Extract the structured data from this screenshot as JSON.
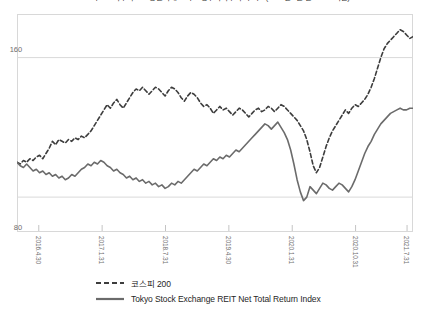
{
  "chart_data": {
    "type": "line",
    "title": "코스피 200 지수와 도쿄증권거래소 리츠 총수익지수 추이 비교(2016년 4월 말 = 100 기준)",
    "xlabel": "",
    "ylabel": "",
    "ylim": [
      60,
      185
    ],
    "yticks": [
      160,
      80
    ],
    "ytick_labels": [
      "160",
      "80"
    ],
    "grid": true,
    "legend_position": "bottom",
    "x_tick_labels": [
      "2016.4.30",
      "2017.1.31",
      "2018.7.31",
      "2019.4.30",
      "2020.1.31",
      "2020.10.31",
      "2021.7.31"
    ],
    "x_tick_positions": [
      0.055,
      0.215,
      0.375,
      0.535,
      0.695,
      0.855,
      0.985
    ],
    "series": [
      {
        "name": "코스피 200",
        "style": "dashed",
        "color": "#3d3d3d",
        "values": [
          100,
          99,
          101,
          100,
          102,
          101,
          103,
          104,
          102,
          105,
          108,
          112,
          110,
          113,
          112,
          111,
          113,
          112,
          114,
          113,
          115,
          114,
          116,
          118,
          121,
          124,
          127,
          130,
          133,
          131,
          134,
          136,
          133,
          131,
          134,
          137,
          140,
          142,
          141,
          143,
          141,
          139,
          141,
          143,
          142,
          140,
          138,
          141,
          143,
          142,
          140,
          137,
          135,
          138,
          140,
          139,
          137,
          134,
          132,
          133,
          131,
          128,
          130,
          132,
          130,
          131,
          129,
          127,
          129,
          131,
          130,
          128,
          126,
          128,
          130,
          131,
          129,
          130,
          132,
          131,
          129,
          131,
          133,
          132,
          130,
          128,
          126,
          124,
          121,
          118,
          113,
          106,
          98,
          94,
          97,
          103,
          109,
          114,
          118,
          121,
          124,
          127,
          130,
          128,
          131,
          133,
          132,
          134,
          136,
          139,
          143,
          148,
          154,
          160,
          165,
          168,
          170,
          172,
          174,
          176,
          175,
          173,
          171,
          172
        ]
      },
      {
        "name": "Tokyo Stock Exchange REIT Net Total Return Index",
        "style": "solid",
        "color": "#6b6b6b",
        "values": [
          100,
          98,
          97,
          99,
          97,
          95,
          96,
          94,
          95,
          93,
          94,
          92,
          93,
          91,
          92,
          90,
          91,
          93,
          92,
          94,
          96,
          97,
          99,
          98,
          100,
          99,
          101,
          100,
          98,
          97,
          95,
          96,
          94,
          93,
          91,
          92,
          90,
          91,
          89,
          90,
          88,
          89,
          87,
          88,
          86,
          87,
          85,
          86,
          88,
          87,
          89,
          88,
          90,
          92,
          94,
          96,
          95,
          97,
          99,
          98,
          100,
          102,
          101,
          103,
          102,
          104,
          103,
          105,
          107,
          106,
          108,
          110,
          112,
          114,
          116,
          118,
          120,
          122,
          121,
          119,
          121,
          123,
          120,
          117,
          113,
          107,
          99,
          90,
          83,
          78,
          80,
          86,
          84,
          82,
          85,
          88,
          87,
          85,
          84,
          86,
          88,
          87,
          85,
          83,
          86,
          90,
          95,
          100,
          105,
          109,
          112,
          116,
          119,
          122,
          124,
          126,
          128,
          129,
          130,
          131,
          130,
          130,
          131,
          131
        ]
      }
    ]
  }
}
